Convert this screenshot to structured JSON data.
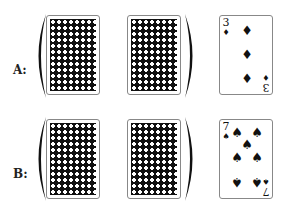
{
  "rows": [
    {
      "label": "A:",
      "cards": [
        {
          "type": "back"
        },
        {
          "type": "back"
        },
        {
          "type": "face",
          "rank": "3",
          "suit": "♦",
          "suit_name": "diamonds",
          "pips": 3
        }
      ],
      "bracket_groups": "first two cards enclosed in parentheses"
    },
    {
      "label": "B:",
      "cards": [
        {
          "type": "back"
        },
        {
          "type": "back"
        },
        {
          "type": "face",
          "rank": "7",
          "suit": "♠",
          "suit_name": "spades",
          "pips": 7
        }
      ],
      "bracket_groups": "first two cards enclosed in parentheses"
    }
  ],
  "colors": {
    "card_back": "#111111",
    "ink": "#111111",
    "border": "#888888"
  }
}
